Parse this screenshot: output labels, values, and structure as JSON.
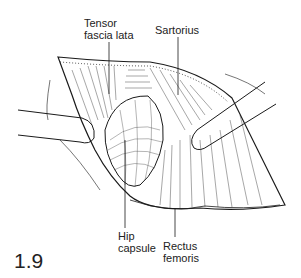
{
  "figure": {
    "number": "1.9",
    "labels": {
      "tensor": [
        "Tensor",
        "fascia lata"
      ],
      "sartorius": "Sartorius",
      "hip_capsule": [
        "Hip",
        "capsule"
      ],
      "rectus": [
        "Rectus",
        "femoris"
      ]
    }
  }
}
